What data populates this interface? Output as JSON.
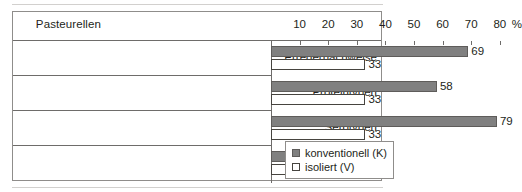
{
  "chart_data": {
    "type": "bar",
    "orientation": "horizontal",
    "title": "Pasteurellen",
    "xlabel": "%",
    "ylabel": "",
    "xlim": [
      0,
      85
    ],
    "ticks": [
      10,
      20,
      30,
      40,
      50,
      60,
      70,
      80
    ],
    "unit_symbol": "%",
    "grid": false,
    "legend_position": "bottom-right",
    "categories": [
      "Erregernachweise",
      "Proteintypen",
      "Serotypen",
      "Toxine"
    ],
    "series": [
      {
        "name": "konventionell (K)",
        "key": "k",
        "color": "#808080",
        "values": [
          69,
          58,
          79,
          23
        ]
      },
      {
        "name": "isoliert (V)",
        "key": "v",
        "color": "#ffffff",
        "values": [
          33,
          33,
          33,
          6
        ]
      }
    ]
  },
  "legend": {
    "items": [
      {
        "label": "konventionell (K)",
        "swatch": "filled-gray-swatch"
      },
      {
        "label": "isoliert (V)",
        "swatch": "hollow-white-swatch"
      }
    ]
  }
}
